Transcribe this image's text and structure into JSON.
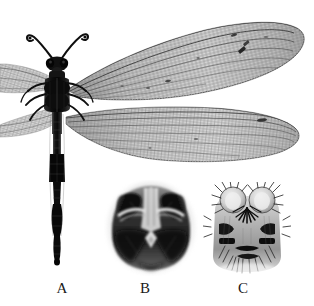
{
  "figure": {
    "type": "grayscale-specimen-plate",
    "background_color": "#ffffff",
    "ink_color": "#1a1a1a",
    "panel_count": 3
  },
  "captions": {
    "a": "A",
    "b": "B",
    "c": "C"
  },
  "panels": [
    {
      "label": "A",
      "name": "whole-specimen-habitus",
      "description": "dorsal view of whole winged insect with long clubbed antennae, dark thorax, elongate segmented abdomen and two pairs of reticulate wings spread to the right",
      "caption_x": 62,
      "caption_y": 288
    },
    {
      "label": "B",
      "name": "head-ventral-view",
      "description": "darkly sclerotised head / terminalia in ventral view with paired dark lateral lobes",
      "caption_x": 145,
      "caption_y": 288
    },
    {
      "label": "C",
      "name": "genitalia-setose-view",
      "description": "terminal genitalia bearing dense dark setae and paired rounded lobes",
      "caption_x": 243,
      "caption_y": 288
    }
  ],
  "colors": {
    "background": "#ffffff",
    "dark_ink": "#141414",
    "mid_gray": "#8d8d8d",
    "light_gray": "#c9c9c9",
    "wing_membrane": "#bdbdbd"
  }
}
